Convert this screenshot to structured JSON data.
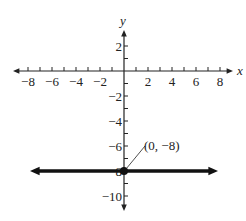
{
  "chart_data": {
    "type": "line",
    "title": "",
    "xlabel": "x",
    "ylabel": "y",
    "xlim": [
      -9,
      9
    ],
    "ylim": [
      -11,
      3.5
    ],
    "x_ticks": [
      -8,
      -7,
      -6,
      -5,
      -4,
      -3,
      -2,
      -1,
      1,
      2,
      3,
      4,
      5,
      6,
      7,
      8
    ],
    "x_tick_labels": [
      "−8",
      "−6",
      "−4",
      "−2",
      "2",
      "4",
      "6",
      "8"
    ],
    "x_tick_label_values": [
      -8,
      -6,
      -4,
      -2,
      2,
      4,
      6,
      8
    ],
    "y_ticks": [
      2,
      1,
      -1,
      -2,
      -3,
      -4,
      -5,
      -6,
      -7,
      -9,
      -10
    ],
    "y_tick_labels": [
      "2",
      "−2",
      "−4",
      "−6",
      "8",
      "−10"
    ],
    "y_tick_label_values": [
      2,
      -2,
      -4,
      -6,
      -8,
      -10
    ],
    "grid": false,
    "series": [
      {
        "name": "y = -8",
        "equation": "y = -8",
        "x": [
          -8,
          8
        ],
        "y": [
          -8,
          -8
        ],
        "arrows": "both"
      }
    ],
    "points": [
      {
        "x": 0,
        "y": -8,
        "label": "(0, −8)"
      }
    ],
    "annotations": [
      {
        "text": "(0, −8)",
        "points_to": [
          0,
          -8
        ]
      }
    ]
  },
  "colors": {
    "axis": "#222222",
    "line": "#111111",
    "text": "#222222"
  }
}
